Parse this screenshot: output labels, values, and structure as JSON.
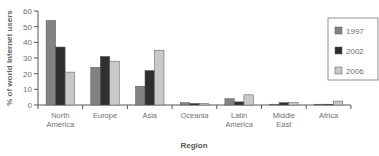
{
  "chart_data": {
    "type": "bar",
    "title": "",
    "xlabel": "Region",
    "ylabel": "% of world Internet users",
    "ylim": [
      0,
      60
    ],
    "yticks": [
      0,
      10,
      20,
      30,
      40,
      50,
      60
    ],
    "grid": false,
    "legend_position": "right",
    "categories": [
      "North America",
      "Europe",
      "Asia",
      "Oceania",
      "Latin America",
      "Middle East",
      "Africa"
    ],
    "category_lines": [
      [
        "North",
        "America"
      ],
      [
        "Europe"
      ],
      [
        "Asia"
      ],
      [
        "Oceania"
      ],
      [
        "Latin",
        "America"
      ],
      [
        "Middle",
        "East"
      ],
      [
        "Africa"
      ]
    ],
    "series": [
      {
        "name": "1997",
        "color": "#828282",
        "values": [
          54,
          24,
          12,
          1.5,
          4,
          0.5,
          0.5
        ]
      },
      {
        "name": "2002",
        "color": "#2f2f2f",
        "values": [
          37,
          31,
          22,
          1,
          2,
          1.5,
          0.5
        ]
      },
      {
        "name": "2006",
        "color": "#c9c9c9",
        "values": [
          21,
          28,
          35,
          1,
          6.5,
          1.5,
          2.5
        ]
      }
    ]
  },
  "colors": {
    "axis": "#555555",
    "text": "#707070",
    "bar_stroke": "#555555",
    "legend_border": "#777777"
  }
}
